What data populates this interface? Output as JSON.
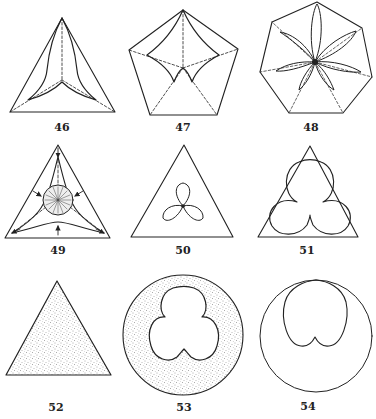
{
  "page": {
    "type": "figure-plate"
  },
  "colors": {
    "ink": "#222222",
    "paper": "#ffffff",
    "stipple": "#555555"
  },
  "figures": [
    {
      "number": "46",
      "shape": "triangle with three curved concave inner arms and dashed lines from center to vertices",
      "label_pos": [
        62,
        121
      ]
    },
    {
      "number": "47",
      "shape": "pentagon with curved inner star and dashed lines from center to vertices",
      "label_pos": [
        183,
        121
      ]
    },
    {
      "number": "48",
      "shape": "heptagon with seven lens-shaped petals radiating from center and dashed lines",
      "label_pos": [
        311,
        121
      ]
    },
    {
      "number": "49",
      "shape": "triangle with inner curved star, hatched central circle and arrows",
      "label_pos": [
        58,
        244
      ]
    },
    {
      "number": "50",
      "shape": "triangle with small three-leaf trefoil at center",
      "label_pos": [
        183,
        244
      ]
    },
    {
      "number": "51",
      "shape": "triangle with large trefoil touching the sides",
      "label_pos": [
        307,
        244
      ]
    },
    {
      "number": "52",
      "shape": "stippled filled triangle",
      "label_pos": [
        56,
        401
      ]
    },
    {
      "number": "53",
      "shape": "stippled circle with white trefoil cut out",
      "label_pos": [
        184,
        401
      ]
    },
    {
      "number": "54",
      "shape": "circle with inverted heart/cardioid touching the top",
      "label_pos": [
        308,
        400
      ]
    }
  ]
}
